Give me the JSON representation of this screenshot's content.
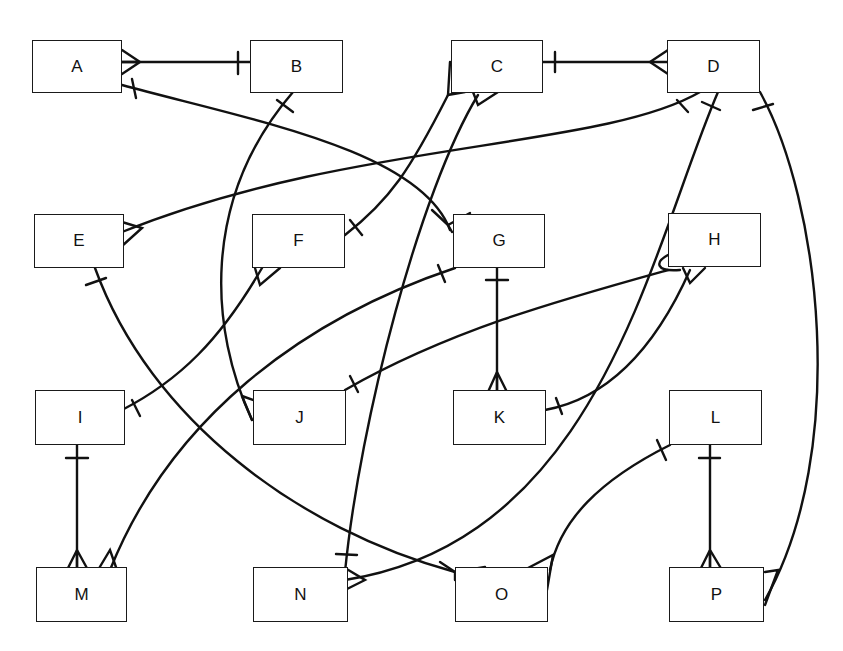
{
  "diagram": {
    "type": "entity-relationship (crow's foot notation)",
    "entities": [
      {
        "id": "A",
        "label": "A"
      },
      {
        "id": "B",
        "label": "B"
      },
      {
        "id": "C",
        "label": "C"
      },
      {
        "id": "D",
        "label": "D"
      },
      {
        "id": "E",
        "label": "E"
      },
      {
        "id": "F",
        "label": "F"
      },
      {
        "id": "G",
        "label": "G"
      },
      {
        "id": "H",
        "label": "H"
      },
      {
        "id": "I",
        "label": "I"
      },
      {
        "id": "J",
        "label": "J"
      },
      {
        "id": "K",
        "label": "K"
      },
      {
        "id": "L",
        "label": "L"
      },
      {
        "id": "M",
        "label": "M"
      },
      {
        "id": "N",
        "label": "N"
      },
      {
        "id": "O",
        "label": "O"
      },
      {
        "id": "P",
        "label": "P"
      }
    ],
    "relationships": [
      {
        "one": "B",
        "many": "A"
      },
      {
        "one": "A",
        "many": "G"
      },
      {
        "one": "B",
        "many": "J"
      },
      {
        "one": "C",
        "many": "D"
      },
      {
        "one": "F",
        "many": "C"
      },
      {
        "one": "N",
        "many": "C"
      },
      {
        "one": "D",
        "many": "E"
      },
      {
        "one": "D",
        "many": "N"
      },
      {
        "one": "D",
        "many": "P"
      },
      {
        "one": "E",
        "many": "O"
      },
      {
        "one": "I",
        "many": "F"
      },
      {
        "one": "G",
        "many": "K"
      },
      {
        "one": "G",
        "many": "M"
      },
      {
        "one": "J",
        "many": "H"
      },
      {
        "one": "K",
        "many": "H"
      },
      {
        "one": "I",
        "many": "M"
      },
      {
        "one": "L",
        "many": "O"
      },
      {
        "one": "L",
        "many": "P"
      }
    ]
  }
}
